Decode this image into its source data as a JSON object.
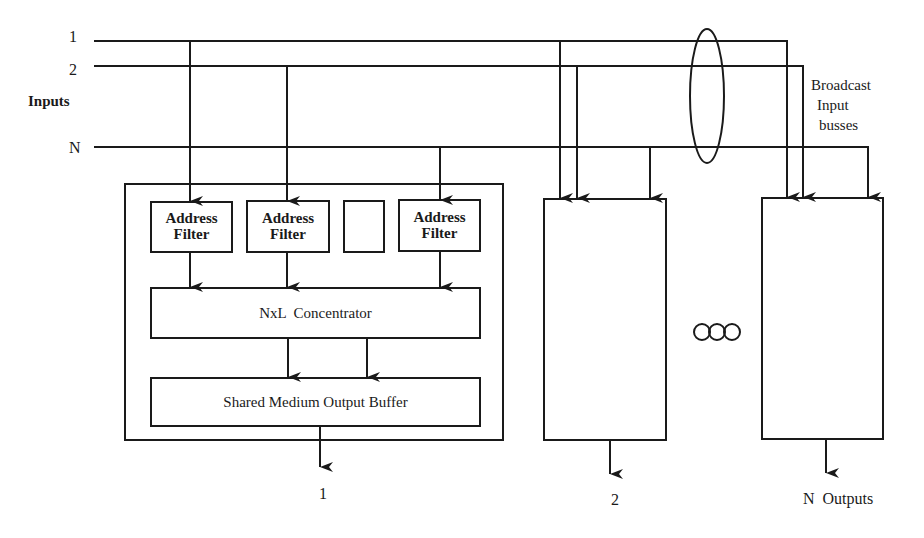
{
  "diagram": {
    "type": "block-diagram",
    "title": "",
    "colors": {
      "line": "#1a1a1a",
      "background": "#ffffff"
    },
    "inputs": {
      "label": "Inputs",
      "lines": [
        {
          "id": "in-1",
          "label": "1"
        },
        {
          "id": "in-2",
          "label": "2"
        },
        {
          "id": "in-N",
          "label": "N"
        }
      ]
    },
    "broadcast_label": {
      "line1": "Broadcast",
      "line2": "Input",
      "line3": "busses"
    },
    "output_module_1": {
      "address_filters": [
        {
          "label_line1": "Address",
          "label_line2": "Filter"
        },
        {
          "label_line1": "Address",
          "label_line2": "Filter"
        },
        {
          "label_line1": "",
          "label_line2": ""
        },
        {
          "label_line1": "Address",
          "label_line2": "Filter"
        }
      ],
      "concentrator": "NxL  Concentrator",
      "buffer": "Shared Medium Output Buffer",
      "output_label": "1"
    },
    "output_module_2": {
      "output_label": "2"
    },
    "output_module_N": {
      "output_label": "N  Outputs"
    },
    "ellipsis": "○○○"
  }
}
